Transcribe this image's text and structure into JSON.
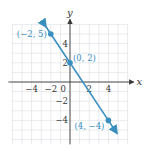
{
  "chart_data": {
    "type": "line",
    "title": "",
    "xlabel": "x",
    "ylabel": "y",
    "xlim": [
      -6,
      6
    ],
    "ylim": [
      -6.5,
      6.5
    ],
    "grid": true,
    "x_ticks": [
      {
        "value": -4,
        "label": "-4"
      },
      {
        "value": -2,
        "label": "-2"
      },
      {
        "value": 0,
        "label": "0"
      },
      {
        "value": 2,
        "label": "2"
      },
      {
        "value": 4,
        "label": "4"
      }
    ],
    "y_ticks": [
      {
        "value": 4,
        "label": "4"
      },
      {
        "value": 2,
        "label": "2"
      },
      {
        "value": -2,
        "label": "-2"
      },
      {
        "value": -4,
        "label": "-4"
      }
    ],
    "series": [
      {
        "name": "line",
        "equation": "y = -3/2 x + 2",
        "color": "#3a8fbf",
        "x_range": [
          -2.5,
          4.9
        ],
        "points": [
          {
            "x": -2,
            "y": 5,
            "label": "(−2, 5)"
          },
          {
            "x": 0,
            "y": 2,
            "label": "(0, 2)"
          },
          {
            "x": 4,
            "y": -4,
            "label": "(4, −4)"
          }
        ]
      }
    ]
  }
}
